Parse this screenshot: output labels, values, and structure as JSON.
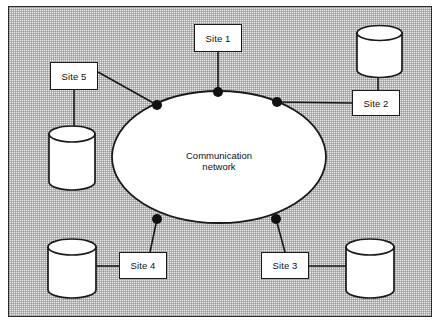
{
  "diagram": {
    "background_color": "#e9e9e9",
    "line_color": "#1a1a1a",
    "shape_fill": "#ffffff",
    "network": {
      "label_line1": "Communication",
      "label_line2": "network",
      "shape": "ellipse",
      "cx": 219,
      "cy": 157,
      "rx": 107,
      "ry": 66
    },
    "connection_nodes": [
      {
        "name": "node-top",
        "x": 218,
        "y": 92,
        "r": 5
      },
      {
        "name": "node-upper-left",
        "x": 157,
        "y": 105,
        "r": 5
      },
      {
        "name": "node-upper-right",
        "x": 277,
        "y": 102,
        "r": 5
      },
      {
        "name": "node-lower-left",
        "x": 157,
        "y": 219,
        "r": 5
      },
      {
        "name": "node-lower-right",
        "x": 276,
        "y": 219,
        "r": 5
      }
    ],
    "sites": [
      {
        "id": "site-1",
        "label": "Site 1",
        "x": 194,
        "y": 24,
        "w": 48,
        "h": 28
      },
      {
        "id": "site-2",
        "label": "Site 2",
        "x": 352,
        "y": 90,
        "w": 48,
        "h": 26
      },
      {
        "id": "site-3",
        "label": "Site 3",
        "x": 261,
        "y": 252,
        "w": 48,
        "h": 27
      },
      {
        "id": "site-4",
        "label": "Site 4",
        "x": 119,
        "y": 252,
        "w": 48,
        "h": 27
      },
      {
        "id": "site-5",
        "label": "Site 5",
        "x": 50,
        "y": 62,
        "w": 48,
        "h": 28
      }
    ],
    "databases": [
      {
        "id": "db-site-1",
        "owner": "Site 1",
        "present": false
      },
      {
        "id": "db-site-2",
        "owner": "Site 2",
        "cx": 380,
        "cy": 57,
        "w": 46,
        "h": 62
      },
      {
        "id": "db-site-3",
        "owner": "Site 3",
        "cx": 370,
        "cy": 268,
        "w": 48,
        "h": 62
      },
      {
        "id": "db-site-4",
        "owner": "Site 4",
        "cx": 72,
        "cy": 268,
        "w": 48,
        "h": 62
      },
      {
        "id": "db-site-5",
        "owner": "Site 5",
        "cx": 72,
        "cy": 152,
        "w": 46,
        "h": 62
      }
    ],
    "links": [
      {
        "from": "site-1",
        "to": "node-top"
      },
      {
        "from": "site-2",
        "to": "node-upper-right"
      },
      {
        "from": "site-2",
        "to": "db-site-2"
      },
      {
        "from": "site-3",
        "to": "node-lower-right"
      },
      {
        "from": "site-3",
        "to": "db-site-3"
      },
      {
        "from": "site-4",
        "to": "node-lower-left"
      },
      {
        "from": "site-4",
        "to": "db-site-4"
      },
      {
        "from": "site-5",
        "to": "node-upper-left"
      },
      {
        "from": "site-5",
        "to": "db-site-5"
      }
    ]
  }
}
